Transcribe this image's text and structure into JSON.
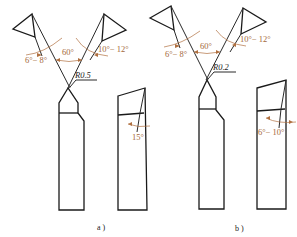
{
  "figure": {
    "type": "technical-drawing",
    "colors": {
      "outline": "#2a2a2a",
      "dimension": "#b07040",
      "label": "#a4693a"
    },
    "panels": [
      {
        "id": "a",
        "caption": "a )",
        "angles": {
          "left_clearance": "6°− 8°",
          "included": "60°",
          "right_clearance": "10°− 12°",
          "side_view": "15°"
        },
        "nose_radius": "R0.5"
      },
      {
        "id": "b",
        "caption": "b )",
        "angles": {
          "left_clearance": "6°− 8°",
          "included": "60°",
          "right_clearance": "10°− 12°",
          "side_view": "6°− 10°"
        },
        "nose_radius": "R0.2"
      }
    ]
  }
}
